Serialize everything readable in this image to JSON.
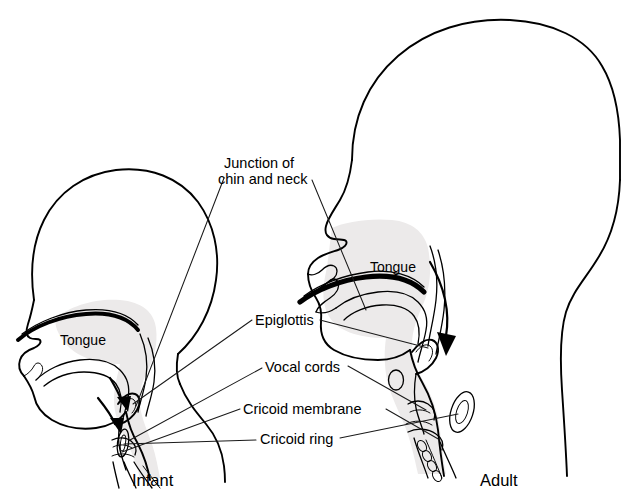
{
  "figure": {
    "background_color": "#ffffff",
    "line_color": "#000000",
    "tissue_fill_color": "#eceaea"
  },
  "captions": {
    "infant": "Infant",
    "adult": "Adult"
  },
  "callouts": {
    "junction_line1": "Junction of",
    "junction_line2": "chin and neck",
    "epiglottis": "Epiglottis",
    "vocal_cords": "Vocal cords",
    "cricoid_membrane": "Cricoid membrane",
    "cricoid_ring": "Cricoid ring"
  },
  "inner_labels": {
    "infant_tongue": "Tongue",
    "adult_tongue": "Tongue"
  },
  "structures": {
    "infant": [
      "cranium-outline",
      "face-profile",
      "hard-palate",
      "tongue-body",
      "oropharynx",
      "epiglottis",
      "vocal-cords",
      "cricoid-membrane",
      "cricoid-ring",
      "trachea",
      "neck-shoulder"
    ],
    "adult": [
      "cranium-outline",
      "face-profile",
      "nasal-turbinates",
      "hard-palate",
      "tongue-body",
      "oropharynx",
      "epiglottis",
      "hyoid",
      "vocal-cords",
      "cricoid-membrane",
      "cricoid-ring",
      "trachea",
      "neck-shoulder"
    ]
  },
  "airflow_arrows": {
    "infant": "downward-airway-arrow",
    "adult": "downward-airway-arrow"
  }
}
